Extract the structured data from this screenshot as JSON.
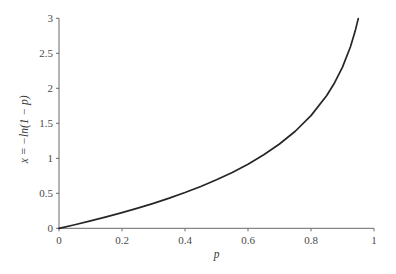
{
  "chart_data": {
    "type": "line",
    "title": "",
    "xlabel": "p",
    "ylabel": "x = −ln(1 − p)",
    "xlim": [
      0,
      1
    ],
    "ylim": [
      0,
      3
    ],
    "grid": false,
    "legend": "none",
    "x_ticks": [
      "0",
      "0.2",
      "0.4",
      "0.6",
      "0.8",
      "1"
    ],
    "x_tick_values": [
      0,
      0.2,
      0.4,
      0.6,
      0.8,
      1
    ],
    "y_ticks": [
      "0",
      "0.5",
      "1",
      "1.5",
      "2",
      "2.5",
      "3"
    ],
    "y_tick_values": [
      0,
      0.5,
      1,
      1.5,
      2,
      2.5,
      3
    ],
    "series": [
      {
        "name": "x = −ln(1 − p)",
        "color": "#262626",
        "x": [
          0,
          0.05,
          0.1,
          0.15,
          0.2,
          0.25,
          0.3,
          0.35,
          0.4,
          0.45,
          0.5,
          0.55,
          0.6,
          0.65,
          0.7,
          0.75,
          0.8,
          0.85,
          0.875,
          0.9,
          0.925,
          0.94,
          0.95
        ],
        "y": [
          0,
          0.0513,
          0.1054,
          0.1625,
          0.2231,
          0.2877,
          0.3567,
          0.4308,
          0.5108,
          0.5978,
          0.6931,
          0.7985,
          0.9163,
          1.0498,
          1.204,
          1.3863,
          1.6094,
          1.8971,
          2.0794,
          2.3026,
          2.5903,
          2.8134,
          2.9957
        ]
      }
    ]
  }
}
